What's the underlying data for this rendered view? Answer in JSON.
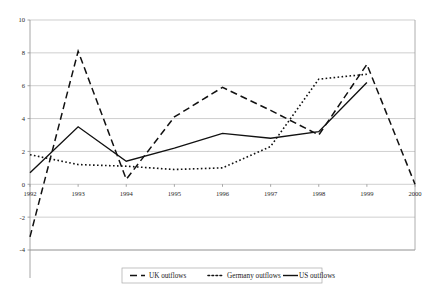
{
  "chart_data": {
    "type": "line",
    "title": "",
    "subtitle": "",
    "xlabel": "",
    "ylabel": "",
    "categories": [
      "1992",
      "1993",
      "1994",
      "1995",
      "1996",
      "1997",
      "1998",
      "1999",
      "2000"
    ],
    "x": [
      1992,
      1993,
      1994,
      1995,
      1996,
      1997,
      1998,
      1999,
      2000
    ],
    "xlim": [
      1992,
      2000
    ],
    "ylim": [
      -4,
      10
    ],
    "yticks": [
      -4,
      -2,
      0,
      2,
      4,
      6,
      8,
      10
    ],
    "ytick_labels": [
      "-4",
      "-2",
      "0",
      "2",
      "4",
      "6",
      "8",
      "10"
    ],
    "xtick_labels": [
      "1992",
      "1993",
      "1994",
      "1995",
      "1996",
      "1997",
      "1998",
      "1999",
      "2000"
    ],
    "grid": true,
    "grid_axis": "y",
    "legend_position": "bottom",
    "series": [
      {
        "name": "UK outflows",
        "style": "dashed",
        "color": "#111111",
        "x": [
          1992,
          1993,
          1994,
          1995,
          1996,
          1997,
          1998,
          1999,
          2000
        ],
        "values": [
          -3.2,
          8.1,
          0.3,
          4.1,
          5.9,
          4.5,
          3.0,
          7.3,
          0.0
        ]
      },
      {
        "name": "Germany outflows",
        "style": "dotted",
        "color": "#111111",
        "x": [
          1992,
          1993,
          1994,
          1995,
          1996,
          1997,
          1998,
          1999
        ],
        "values": [
          1.8,
          1.2,
          1.1,
          0.9,
          1.0,
          2.3,
          6.4,
          6.7
        ]
      },
      {
        "name": "US outflows",
        "style": "solid",
        "color": "#111111",
        "x": [
          1992,
          1993,
          1994,
          1995,
          1996,
          1997,
          1998,
          1999
        ],
        "values": [
          0.7,
          3.5,
          1.4,
          2.2,
          3.1,
          2.8,
          3.2,
          6.2
        ]
      }
    ]
  },
  "legend": {
    "items": [
      {
        "label": "UK outflows",
        "style": "dashed"
      },
      {
        "label": "Germany outflows",
        "style": "dotted"
      },
      {
        "label": "US outflows",
        "style": "solid"
      }
    ]
  }
}
